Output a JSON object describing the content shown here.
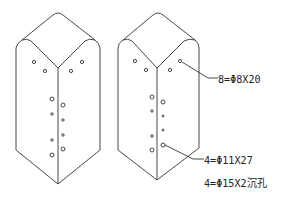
{
  "drawing": {
    "description": "Two isometric views of a rectangular block with holes",
    "stroke_color": "#333333",
    "background": "#ffffff"
  },
  "annotations": {
    "a1": "8=Φ8X20",
    "a2": "4=Φ11X27",
    "a3": "4=Φ15X2沉孔"
  }
}
